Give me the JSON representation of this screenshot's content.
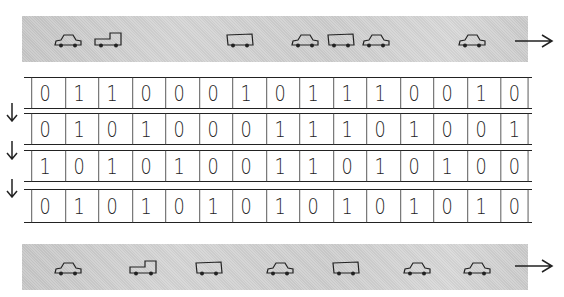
{
  "title": "",
  "roads": {
    "top": {
      "direction": "right",
      "vehicles": [
        {
          "type": "car",
          "pos": 0.09
        },
        {
          "type": "truck",
          "pos": 0.17
        },
        {
          "type": "van",
          "pos": 0.43
        },
        {
          "type": "car",
          "pos": 0.56
        },
        {
          "type": "van",
          "pos": 0.63
        },
        {
          "type": "car",
          "pos": 0.7
        },
        {
          "type": "car",
          "pos": 0.89
        }
      ]
    },
    "bottom": {
      "direction": "right",
      "vehicles": [
        {
          "type": "car",
          "pos": 0.09
        },
        {
          "type": "truck",
          "pos": 0.24
        },
        {
          "type": "van",
          "pos": 0.37
        },
        {
          "type": "car",
          "pos": 0.51
        },
        {
          "type": "van",
          "pos": 0.64
        },
        {
          "type": "car",
          "pos": 0.78
        },
        {
          "type": "car",
          "pos": 0.9
        }
      ]
    }
  },
  "registers": [
    {
      "bits": [
        "0",
        "1",
        "1",
        "0",
        "0",
        "0",
        "1",
        "0",
        "1",
        "1",
        "1",
        "0",
        "0",
        "1",
        "0"
      ]
    },
    {
      "bits": [
        "0",
        "1",
        "0",
        "1",
        "0",
        "0",
        "0",
        "1",
        "1",
        "1",
        "0",
        "1",
        "0",
        "0",
        "1"
      ]
    },
    {
      "bits": [
        "1",
        "0",
        "1",
        "0",
        "1",
        "0",
        "0",
        "1",
        "1",
        "0",
        "1",
        "0",
        "1",
        "0",
        "0"
      ]
    },
    {
      "bits": [
        "0",
        "1",
        "0",
        "1",
        "0",
        "1",
        "0",
        "1",
        "0",
        "1",
        "0",
        "1",
        "0",
        "1",
        "0"
      ]
    }
  ],
  "shift_arrows": {
    "count": 3,
    "direction": "down",
    "icon": "arrow-down-icon"
  },
  "flow_arrows": {
    "icon": "arrow-right-icon"
  },
  "colors": {
    "road": "#cfcfcf",
    "ink": "#222222",
    "background": "#ffffff"
  }
}
